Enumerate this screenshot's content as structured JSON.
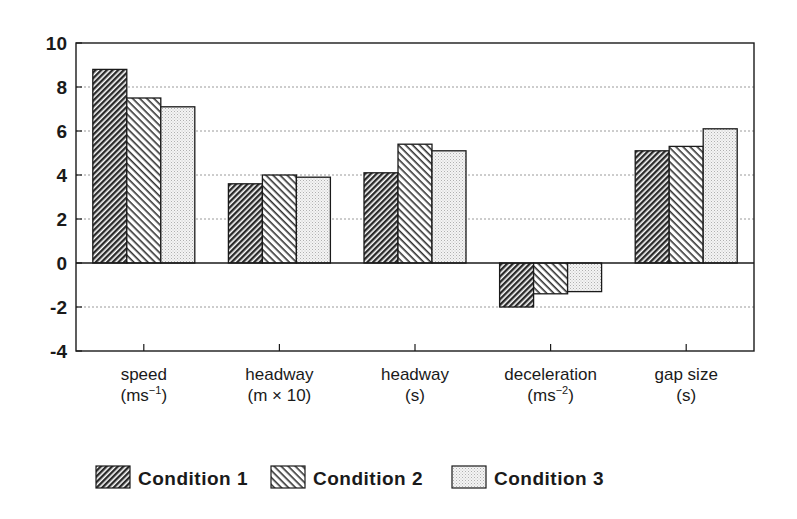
{
  "chart_data": {
    "type": "bar",
    "title": "",
    "xlabel": "",
    "ylabel": "",
    "ylim": [
      -4,
      10
    ],
    "yticks": [
      -4,
      -2,
      0,
      2,
      4,
      6,
      8,
      10
    ],
    "ytick_labels": [
      "-4",
      "-2",
      "0",
      "2",
      "4",
      "6",
      "8",
      "10"
    ],
    "grid": "horizontal dotted",
    "categories": [
      {
        "line1": "speed",
        "line2": "(ms",
        "sup": "−1",
        "tail": ")"
      },
      {
        "line1": "headway",
        "line2": "(m × 10)",
        "sup": "",
        "tail": ""
      },
      {
        "line1": "headway",
        "line2": "(s)",
        "sup": "",
        "tail": ""
      },
      {
        "line1": "deceleration",
        "line2": "(ms",
        "sup": "−2",
        "tail": ")"
      },
      {
        "line1": "gap size",
        "line2": "(s)",
        "sup": "",
        "tail": ""
      }
    ],
    "series": [
      {
        "name": "Condition 1",
        "pattern": "dense-backslash-hatch",
        "values": [
          8.8,
          3.6,
          4.1,
          -2.0,
          5.1
        ]
      },
      {
        "name": "Condition 2",
        "pattern": "forward-slash-hatch",
        "values": [
          7.5,
          4.0,
          5.4,
          -1.4,
          5.3
        ]
      },
      {
        "name": "Condition 3",
        "pattern": "light-stipple",
        "values": [
          7.1,
          3.9,
          5.1,
          -1.3,
          6.1
        ]
      }
    ],
    "legend_position": "bottom",
    "colors": {
      "ink": "#1a1a1a",
      "grid": "#9a9a9a",
      "stipple_bg": "#f0f0f0"
    }
  }
}
